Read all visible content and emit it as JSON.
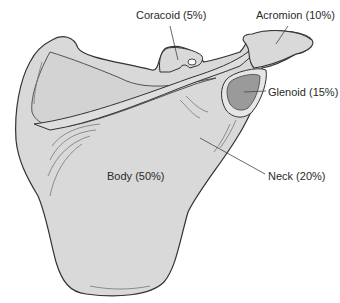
{
  "figure": {
    "labels": {
      "coracoid": "Coracoid (5%)",
      "acromion": "Acromion (10%)",
      "glenoid": "Glenoid (15%)",
      "neck": "Neck (20%)",
      "body": "Body (50%)"
    },
    "colors": {
      "bone_fill": "#d9d9d9",
      "outline": "#333333",
      "shade": "#8a8a8a",
      "background": "#ffffff"
    }
  }
}
